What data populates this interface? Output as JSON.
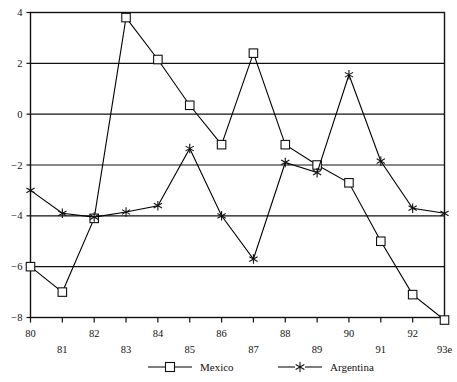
{
  "chart_data": {
    "type": "line",
    "title": "",
    "subtitle": "",
    "xlabel": "",
    "ylabel": "",
    "x": [
      "80",
      "81",
      "82",
      "83",
      "84",
      "85",
      "86",
      "87",
      "88",
      "89",
      "90",
      "91",
      "92",
      "93e"
    ],
    "x_numeric": [
      80,
      81,
      82,
      83,
      84,
      85,
      86,
      87,
      88,
      89,
      90,
      91,
      92,
      93
    ],
    "categories": [
      "80",
      "81",
      "82",
      "83",
      "84",
      "85",
      "86",
      "87",
      "88",
      "89",
      "90",
      "91",
      "92",
      "93e"
    ],
    "series": [
      {
        "name": "Mexico",
        "marker": "square",
        "color": "#000000",
        "values": [
          -6.0,
          -7.0,
          -4.1,
          3.8,
          2.15,
          0.35,
          -1.2,
          2.4,
          -1.2,
          -2.0,
          -2.7,
          -5.0,
          -7.1,
          -8.1
        ]
      },
      {
        "name": "Argentina",
        "marker": "asterisk",
        "color": "#000000",
        "values": [
          -3.0,
          -3.9,
          -4.05,
          -3.85,
          -3.6,
          -1.35,
          -4.0,
          -5.7,
          -1.9,
          -2.3,
          1.55,
          -1.85,
          -3.7,
          -3.9
        ]
      }
    ],
    "ylim": [
      -8,
      4
    ],
    "xlim": [
      80,
      93
    ],
    "yticks": [
      4,
      2,
      0,
      -2,
      -4,
      -6,
      -8
    ],
    "ytick_labels": [
      "4",
      "2",
      "0",
      "−2",
      "−4",
      "−6",
      "−8"
    ],
    "xtick_labels_upper": [
      "80",
      "82",
      "84",
      "86",
      "88",
      "90",
      "92"
    ],
    "xtick_labels_lower": [
      "81",
      "83",
      "85",
      "87",
      "89",
      "91",
      "93e"
    ],
    "grid": true,
    "grid_axis": "y",
    "legend_position": "bottom",
    "legend": [
      "Mexico",
      "Argentina"
    ]
  },
  "axis": {
    "y_labels": [
      "4",
      "2",
      "0",
      "−2",
      "−4",
      "−6",
      "−8"
    ],
    "x_labels_row1": [
      "80",
      "82",
      "84",
      "86",
      "88",
      "90",
      "92"
    ],
    "x_labels_row2": [
      "81",
      "83",
      "85",
      "87",
      "89",
      "91",
      "93e"
    ]
  },
  "legend": {
    "items": [
      {
        "label": "Mexico",
        "marker": "square"
      },
      {
        "label": "Argentina",
        "marker": "asterisk"
      }
    ]
  }
}
